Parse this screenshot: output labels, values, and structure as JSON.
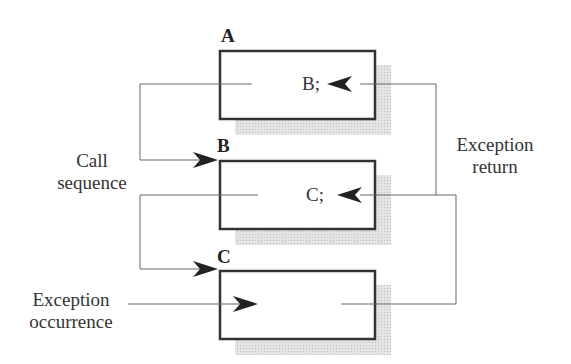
{
  "diagram": {
    "boxes": [
      {
        "id": "A",
        "label": "A",
        "statement": "B;"
      },
      {
        "id": "B",
        "label": "B",
        "statement": "C;"
      },
      {
        "id": "C",
        "label": "C",
        "statement": ""
      }
    ],
    "labels": {
      "call_sequence_line1": "Call",
      "call_sequence_line2": "sequence",
      "exception_return_line1": "Exception",
      "exception_return_line2": "return",
      "exception_occurrence_line1": "Exception",
      "exception_occurrence_line2": "occurrence"
    },
    "edges": [
      {
        "from": "A",
        "to": "B",
        "type": "call"
      },
      {
        "from": "B",
        "to": "C",
        "type": "call"
      },
      {
        "from": "external",
        "to": "C",
        "type": "exception-occurrence"
      },
      {
        "from": "C",
        "to": "B",
        "type": "exception-return"
      },
      {
        "from": "B",
        "to": "A",
        "type": "exception-return"
      }
    ],
    "colors": {
      "line": "#555555",
      "box_border": "#333333",
      "shadow": "#d8d8d8",
      "arrow": "#222222"
    }
  }
}
